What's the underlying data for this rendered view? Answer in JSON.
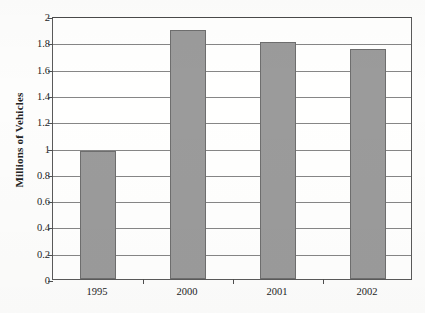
{
  "chart_data": {
    "type": "bar",
    "title": "",
    "subtitle": "",
    "xlabel": "",
    "ylabel": "Millions of Vehicles",
    "categories": [
      "1995",
      "2000",
      "2001",
      "2002"
    ],
    "values": [
      0.97,
      1.89,
      1.8,
      1.75
    ],
    "series": [
      {
        "name": "Vehicles",
        "values": [
          0.97,
          1.89,
          1.8,
          1.75
        ]
      }
    ],
    "ylim": [
      0,
      2
    ],
    "xlim": [
      0,
      4
    ],
    "y_ticks": [
      0,
      0.2,
      0.4,
      0.6,
      0.8,
      1,
      1.2,
      1.4,
      1.6,
      1.8,
      2
    ],
    "y_tick_labels": [
      "0",
      "0.2",
      "0.4",
      "0.6",
      "0.8",
      "1",
      "1.2",
      "1.4",
      "1.6",
      "1.8",
      "2"
    ],
    "grid": "horizontal",
    "legend": "none",
    "bar_color": "#9b9b9b",
    "bar_border_color": "#6e6e6e",
    "grid_color": "#868686",
    "axis_color": "#4e4e4e",
    "background_color": "#fdfdfc",
    "annotations": []
  }
}
